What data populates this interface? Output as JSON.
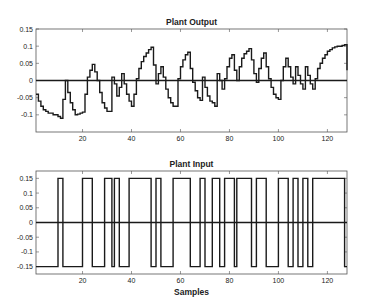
{
  "figure": {
    "background": "#ffffff",
    "line_color": "#1a1a1a"
  },
  "chart_data": [
    {
      "type": "line",
      "step": true,
      "title": "Plant Output",
      "xlabel": "",
      "ylabel": "",
      "xlim": [
        1,
        128
      ],
      "ylim": [
        -0.15,
        0.15
      ],
      "xticks": [
        20,
        40,
        60,
        80,
        100,
        120
      ],
      "yticks": [
        0.15,
        0.1,
        0.05,
        0,
        -0.05,
        -0.1
      ],
      "ytick_labels": [
        "0.15",
        "0.1",
        "0.05",
        "0",
        "-0.05",
        "-0.1"
      ],
      "grid": false,
      "zero_line": true,
      "series": [
        {
          "name": "Plant Output",
          "x_start": 1,
          "values": [
            -0.04,
            -0.06,
            -0.075,
            -0.085,
            -0.09,
            -0.095,
            -0.095,
            -0.1,
            -0.1,
            -0.105,
            -0.11,
            -0.055,
            0.0,
            -0.035,
            -0.065,
            -0.085,
            -0.1,
            -0.098,
            -0.095,
            -0.092,
            -0.04,
            0.01,
            0.03,
            0.047,
            0.025,
            0.0,
            -0.035,
            -0.065,
            -0.08,
            -0.09,
            -0.09,
            0.01,
            -0.01,
            -0.045,
            -0.02,
            0.02,
            -0.01,
            -0.04,
            -0.06,
            -0.075,
            -0.04,
            0.005,
            0.035,
            0.055,
            0.07,
            0.08,
            0.09,
            0.097,
            0.045,
            -0.01,
            0.02,
            0.04,
            0.01,
            -0.025,
            -0.05,
            -0.065,
            -0.075,
            -0.075,
            0.005,
            0.04,
            0.06,
            0.075,
            0.082,
            0.035,
            -0.005,
            -0.03,
            -0.05,
            -0.058,
            0.01,
            -0.02,
            -0.045,
            -0.06,
            -0.065,
            -0.075,
            0.02,
            0.0,
            -0.025,
            0.005,
            0.04,
            0.065,
            0.075,
            0.03,
            0.0,
            0.04,
            0.065,
            0.078,
            0.085,
            0.093,
            0.06,
            0.02,
            -0.005,
            0.035,
            0.065,
            0.08,
            0.04,
            0.005,
            -0.02,
            -0.04,
            -0.05,
            -0.055,
            0.0,
            0.04,
            0.065,
            0.04,
            0.01,
            -0.01,
            0.04,
            0.015,
            -0.01,
            -0.025,
            0.04,
            0.015,
            -0.01,
            -0.025,
            0.005,
            0.035,
            0.05,
            0.065,
            0.075,
            0.085,
            0.09,
            0.095,
            0.098,
            0.1,
            0.1,
            0.102,
            0.104,
            0.03
          ]
        }
      ]
    },
    {
      "type": "line",
      "step": true,
      "title": "Plant Input",
      "xlabel": "Samples",
      "ylabel": "",
      "xlim": [
        1,
        128
      ],
      "ylim": [
        -0.175,
        0.175
      ],
      "xticks": [
        20,
        40,
        60,
        80,
        100,
        120
      ],
      "yticks": [
        0.15,
        0.1,
        0.05,
        0,
        -0.05,
        -0.1,
        -0.15
      ],
      "ytick_labels": [
        "0.15",
        "0.1",
        "0.05",
        "0",
        "-0.05",
        "-0.1",
        "-0.15"
      ],
      "grid": false,
      "zero_line": true,
      "series": [
        {
          "name": "Plant Input",
          "levels": [
            -0.15,
            0.15
          ],
          "high_intervals": [
            [
              10,
              12
            ],
            [
              20,
              24
            ],
            [
              29,
              32
            ],
            [
              33,
              35
            ],
            [
              39,
              48
            ],
            [
              50,
              52
            ],
            [
              57,
              64
            ],
            [
              68,
              70
            ],
            [
              73,
              76
            ],
            [
              78,
              82
            ],
            [
              83,
              89
            ],
            [
              91,
              95
            ],
            [
              100,
              104
            ],
            [
              106,
              108
            ],
            [
              110,
              112
            ],
            [
              114,
              127
            ]
          ]
        }
      ]
    }
  ],
  "labels": {
    "top_title": "Plant Output",
    "bottom_title": "Plant Input",
    "xlabel": "Samples"
  }
}
